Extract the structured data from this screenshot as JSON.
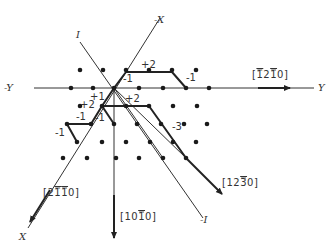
{
  "figure": {
    "type": "crystal-lattice-vector-diagram",
    "origin": [
      114,
      88
    ],
    "axes": [
      {
        "name": "Y",
        "label": "Y",
        "label_pos": [
          318,
          91
        ],
        "from": [
          34,
          88
        ],
        "to": [
          314,
          88
        ]
      },
      {
        "name": "-Y",
        "label": "-Y",
        "label_pos": [
          4,
          91
        ]
      },
      {
        "name": "X",
        "label": "X",
        "label_pos": [
          19,
          240
        ],
        "from": [
          114,
          88
        ],
        "to": [
          26,
          230
        ]
      },
      {
        "name": "-X",
        "label": "-X",
        "label_pos": [
          154,
          23
        ],
        "from": [
          114,
          88
        ],
        "to": [
          160,
          18
        ]
      },
      {
        "name": "I",
        "label": "I",
        "label_pos": [
          76,
          38
        ],
        "from": [
          80,
          42
        ],
        "to": [
          114,
          88
        ]
      },
      {
        "name": "-I",
        "label": "-I",
        "label_pos": [
          200,
          223
        ],
        "from": [
          114,
          88
        ],
        "to": [
          203,
          218
        ]
      }
    ],
    "directions": [
      {
        "label": "[1̄21̄0]",
        "display": "[̅2̅̅0]",
        "text": "[1210]",
        "bars": [
          0,
          2
        ],
        "pos": [
          252,
          78
        ]
      },
      {
        "label": "[21̄1̄0]",
        "text": "[2110]",
        "bars": [
          1,
          2
        ],
        "pos": [
          43,
          196
        ]
      },
      {
        "label": "[101̄0]",
        "text": "[1010]",
        "bars": [
          2
        ],
        "pos": [
          120,
          220
        ]
      },
      {
        "label": "[123̄0]",
        "text": "[1230]",
        "bars": [
          2
        ],
        "pos": [
          222,
          186
        ]
      }
    ],
    "step_labels": [
      {
        "text": "+2",
        "pos": [
          141,
          68
        ]
      },
      {
        "text": "-1",
        "pos": [
          123,
          82
        ]
      },
      {
        "text": "-1",
        "pos": [
          186,
          81
        ]
      },
      {
        "text": "+1",
        "pos": [
          90,
          100
        ]
      },
      {
        "text": "+2",
        "pos": [
          125,
          102
        ]
      },
      {
        "text": "+2",
        "pos": [
          80,
          108
        ]
      },
      {
        "text": "-1",
        "pos": [
          76,
          120
        ]
      },
      {
        "text": "-1",
        "pos": [
          95,
          121
        ]
      },
      {
        "text": "-1",
        "pos": [
          55,
          136
        ]
      },
      {
        "text": "-3",
        "pos": [
          172,
          130
        ]
      }
    ],
    "lattice_points": [
      [
        80,
        70
      ],
      [
        103,
        70
      ],
      [
        126,
        70
      ],
      [
        149,
        70
      ],
      [
        172,
        70
      ],
      [
        196,
        70
      ],
      [
        71,
        88
      ],
      [
        93,
        88
      ],
      [
        139,
        88
      ],
      [
        163,
        88
      ],
      [
        186,
        88
      ],
      [
        209,
        88
      ],
      [
        80,
        106
      ],
      [
        102,
        106
      ],
      [
        126,
        106
      ],
      [
        149,
        106
      ],
      [
        173,
        106
      ],
      [
        197,
        106
      ],
      [
        67,
        124
      ],
      [
        91,
        124
      ],
      [
        114,
        124
      ],
      [
        137,
        124
      ],
      [
        161,
        124
      ],
      [
        184,
        124
      ],
      [
        207,
        124
      ],
      [
        77,
        142
      ],
      [
        102,
        142
      ],
      [
        126,
        142
      ],
      [
        150,
        142
      ],
      [
        173,
        142
      ],
      [
        196,
        142
      ],
      [
        63,
        158
      ],
      [
        87,
        158
      ],
      [
        116,
        158
      ],
      [
        139,
        158
      ],
      [
        163,
        158
      ],
      [
        186,
        158
      ]
    ]
  }
}
